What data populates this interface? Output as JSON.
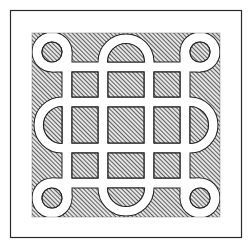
{
  "figure": {
    "colors": {
      "background": "#ffffff",
      "frame": "#2a2a2a",
      "hatch_line": "#3a3a3a",
      "hatch_bg": "#e6e6e6",
      "band": "#ffffff",
      "cell_outline": "#222222"
    },
    "frame": {
      "x": 10,
      "y": 10,
      "width": 232,
      "height": 228
    },
    "hatched_field": {
      "x": 32,
      "y": 33,
      "width": 188,
      "height": 184
    },
    "grid_line_centers": [
      67,
      103,
      149,
      185
    ],
    "band_width": 9,
    "corner_rings": {
      "centers": [
        [
          52,
          52
        ],
        [
          200,
          52
        ],
        [
          52,
          198
        ],
        [
          200,
          198
        ]
      ],
      "radius": 15
    },
    "arches": {
      "top": [
        126,
        62
      ],
      "bottom": [
        126,
        188
      ],
      "left": [
        62,
        125
      ],
      "right": [
        190,
        125
      ],
      "radius": 23
    },
    "hatch": {
      "direction": "diagonal-up-right",
      "spacing": 3
    }
  }
}
